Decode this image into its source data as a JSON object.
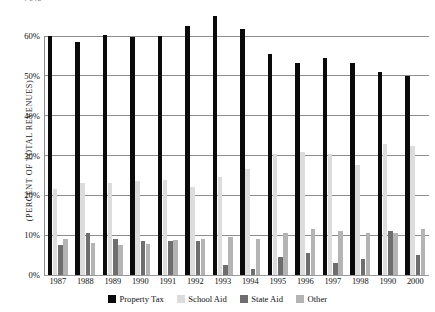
{
  "chart_data": {
    "type": "bar",
    "title": "",
    "xlabel": "",
    "ylabel": "(PERCENT OF TOTAL REVENUES)",
    "ylim": [
      0,
      60
    ],
    "ytick_labels": [
      "0%",
      "10%",
      "20%",
      "30%",
      "40%",
      "50%",
      "60%"
    ],
    "ytick_values": [
      0,
      10,
      20,
      30,
      40,
      50,
      60
    ],
    "clipped_top_label": "70%",
    "grid": true,
    "legend_position": "bottom",
    "categories": [
      "1987",
      "1988",
      "1989",
      "1990",
      "1991",
      "1992",
      "1993",
      "1994",
      "1995",
      "1996",
      "1997",
      "1998",
      "1990",
      "2000"
    ],
    "series": [
      {
        "name": "Property Tax",
        "color": "#0a0a0a",
        "values": [
          60.0,
          58.5,
          60.3,
          59.8,
          60.0,
          62.5,
          65.0,
          61.8,
          55.5,
          53.2,
          54.5,
          53.2,
          51.0,
          50.0
        ]
      },
      {
        "name": "School Aid",
        "color": "#dcdcdc",
        "values": [
          21.5,
          23.0,
          23.0,
          23.5,
          23.8,
          22.0,
          24.5,
          26.5,
          30.5,
          31.0,
          30.5,
          27.5,
          33.0,
          32.5
        ]
      },
      {
        "name": "State Aid",
        "color": "#6e6e6e",
        "values": [
          7.5,
          10.5,
          9.0,
          8.5,
          8.5,
          8.5,
          2.5,
          1.5,
          4.5,
          5.5,
          3.0,
          4.0,
          11.0,
          5.0
        ]
      },
      {
        "name": "Other",
        "color": "#b4b4b4",
        "values": [
          9.0,
          8.0,
          7.5,
          7.8,
          8.8,
          9.0,
          9.5,
          9.0,
          10.5,
          11.5,
          11.0,
          10.5,
          10.5,
          11.5
        ]
      }
    ]
  },
  "legend": {
    "items": [
      {
        "label": "Property Tax",
        "swatch": "property-tax-swatch"
      },
      {
        "label": "School Aid",
        "swatch": "school-aid-swatch"
      },
      {
        "label": "State Aid",
        "swatch": "state-aid-swatch"
      },
      {
        "label": "Other",
        "swatch": "other-swatch"
      }
    ]
  }
}
